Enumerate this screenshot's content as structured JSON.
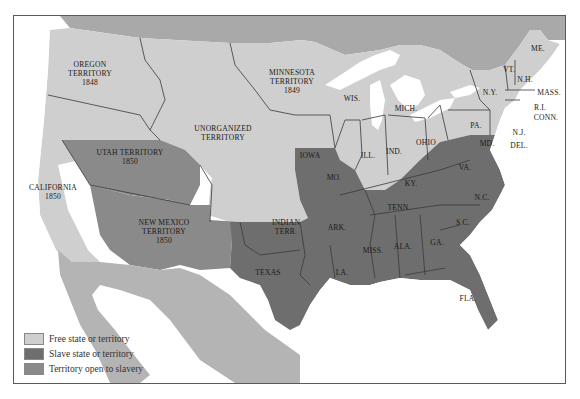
{
  "map": {
    "title": "",
    "colors": {
      "free": "#cfcfcf",
      "slave": "#6e6e6e",
      "open": "#8a8a8a",
      "foreign": "#a9a9a9",
      "water": "#ffffff"
    },
    "regions": {
      "oregon": {
        "name": "OREGON",
        "line2": "TERRITORY",
        "year": "1848"
      },
      "minnesota": {
        "name": "MINNESOTA",
        "line2": "TERRITORY",
        "year": "1849"
      },
      "unorganized": {
        "name": "UNORGANIZED",
        "line2": "TERRITORY"
      },
      "utah": {
        "name": "UTAH TERRITORY",
        "year": "1850"
      },
      "california": {
        "name": "CALIFORNIA",
        "year": "1850"
      },
      "new_mexico": {
        "name": "NEW MEXICO",
        "line2": "TERRITORY",
        "year": "1850"
      },
      "indian": {
        "name": "INDIAN",
        "line2": "TERR."
      },
      "texas": "TEXAS",
      "iowa": "IOWA",
      "wis": "WIS.",
      "mich": "MICH.",
      "ill": "ILL.",
      "ind": "IND.",
      "ohio": "OHIO",
      "mo": "MO.",
      "ark": "ARK.",
      "la": "LA.",
      "miss": "MISS.",
      "ala": "ALA.",
      "ga": "GA.",
      "fla": "FLA.",
      "sc": "S.C.",
      "nc": "N.C.",
      "tenn": "TENN.",
      "ky": "KY.",
      "va": "VA.",
      "md": "MD.",
      "del": "DEL.",
      "nj": "N.J.",
      "pa": "PA.",
      "ny": "N.Y.",
      "vt": "VT.",
      "nh": "N.H.",
      "me": "ME.",
      "mass": "MASS.",
      "ri": "R.I.",
      "conn": "CONN."
    }
  },
  "legend": {
    "items": [
      {
        "label": "Free state or territory",
        "color": "#cfcfcf"
      },
      {
        "label": "Slave state or territory",
        "color": "#6e6e6e"
      },
      {
        "label": "Territory open to slavery",
        "color": "#8a8a8a"
      }
    ]
  }
}
